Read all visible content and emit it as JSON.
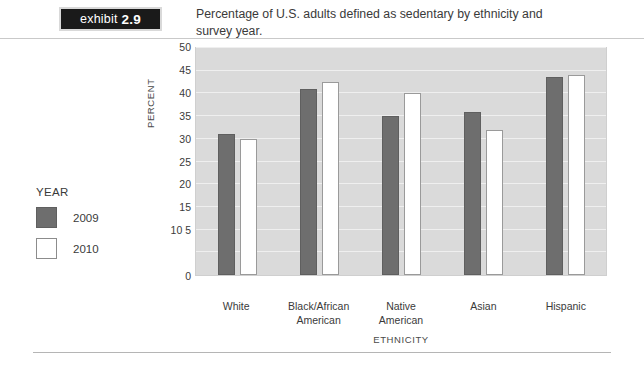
{
  "exhibit": {
    "label": "exhibit",
    "number": "2.9"
  },
  "caption": "Percentage of U.S. adults defined as sedentary by ethnicity and survey year.",
  "legend": {
    "title": "YEAR",
    "items": [
      {
        "label": "2009",
        "color": "#6e6e6e"
      },
      {
        "label": "2010",
        "color": "#ffffff"
      }
    ]
  },
  "chart_data": {
    "type": "bar",
    "title": "Percentage of U.S. adults defined as sedentary by ethnicity and survey year.",
    "xlabel": "ETHNICITY",
    "ylabel": "PERCENT",
    "ylim": [
      0,
      50
    ],
    "yticks": [
      0,
      5,
      10,
      15,
      20,
      25,
      30,
      35,
      40,
      45,
      50
    ],
    "ytick_labels": [
      "0",
      "5",
      "10",
      "15",
      "20",
      "25",
      "30",
      "35",
      "40",
      "45",
      "50"
    ],
    "grid": true,
    "legend_position": "left",
    "categories": [
      "White",
      "Black/African American",
      "Native American",
      "Asian",
      "Hispanic"
    ],
    "series": [
      {
        "name": "2009",
        "color": "#6e6e6e",
        "values": [
          31,
          41,
          35,
          35.8,
          43.7
        ]
      },
      {
        "name": "2010",
        "color": "#ffffff",
        "values": [
          30,
          42.5,
          40,
          32,
          44
        ]
      }
    ]
  }
}
